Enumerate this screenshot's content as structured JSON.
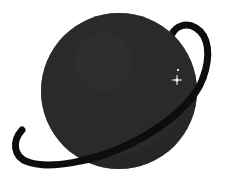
{
  "image": {
    "kind": "illustration",
    "subject": "planet-with-ring",
    "alt_text": "Dark silhouette of a ringed planet with two small stars",
    "width": 241,
    "height": 186,
    "background_color": "#ffffff"
  },
  "palette": {
    "background": "#ffffff",
    "planet_fill": "#2c2c2c",
    "planet_fill_shadow": "#242424",
    "planet_edge": "#313131",
    "ring_color": "#111111",
    "ring_over_planet_color": "#0d0d0d",
    "star_color": "#f2f2f2",
    "noise_color": "#3a3a3a"
  },
  "planet": {
    "label": "planet-disc",
    "center_x": 119,
    "center_y": 91,
    "radius": 78
  },
  "ring": {
    "label": "planet-ring",
    "tilt_degrees": -22,
    "stroke_width": 7,
    "front_path": "M 22 130 C 12 141 13 157 28 162 C 48 169 92 163 132 143 C 170 124 196 99 203 78",
    "back_path": "M 203 78 C 211 56 209 36 196 28 C 186 22 176 26 172 34",
    "tip_upper_right": {
      "x": 196,
      "y": 24
    },
    "tip_lower_left": {
      "x": 22,
      "y": 130
    }
  },
  "stars": [
    {
      "label": "star-small",
      "x": 178,
      "y": 70,
      "size": 2.2,
      "brightness": 0.8
    },
    {
      "label": "star-bright",
      "x": 177,
      "y": 80,
      "size": 3.2,
      "brightness": 1.0
    }
  ]
}
